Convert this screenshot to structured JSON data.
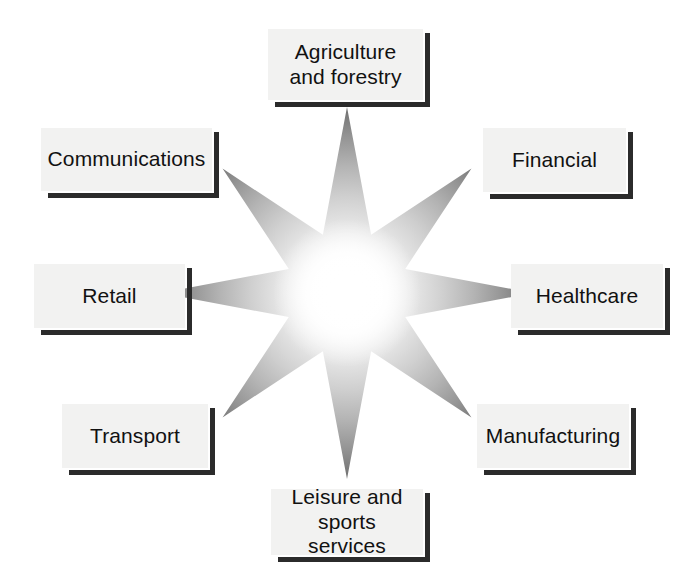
{
  "diagram": {
    "shape": "8-pointed-star",
    "background_color": "#ffffff",
    "box_fill_color": "#f2f2f1",
    "box_shadow_color": "#2b2b2b",
    "text_color": "#111111",
    "star_gradient": {
      "center_color": "#ffffff",
      "mid_color": "#c9c9c9",
      "edge_color": "#6f6f6f"
    },
    "star_center": {
      "x": 347,
      "y": 293
    },
    "star_outer_radius_cardinal": 186,
    "star_outer_radius_diagonal": 176,
    "star_inner_radius": 63,
    "nodes": [
      {
        "id": "agriculture-and-forestry",
        "label": "Agriculture\nand forestry",
        "position": "top",
        "box": {
          "x": 268,
          "y": 29,
          "w": 155,
          "h": 71
        },
        "font_size": 21
      },
      {
        "id": "financial",
        "label": "Financial",
        "position": "top-right",
        "box": {
          "x": 483,
          "y": 128,
          "w": 143,
          "h": 64
        },
        "font_size": 21
      },
      {
        "id": "healthcare",
        "label": "Healthcare",
        "position": "right",
        "box": {
          "x": 511,
          "y": 264,
          "w": 152,
          "h": 64
        },
        "font_size": 21
      },
      {
        "id": "manufacturing",
        "label": "Manufacturing",
        "position": "bottom-right",
        "box": {
          "x": 477,
          "y": 404,
          "w": 152,
          "h": 64
        },
        "font_size": 21
      },
      {
        "id": "leisure-and-sports-services",
        "label": "Leisure and\nsports services",
        "position": "bottom",
        "box": {
          "x": 271,
          "y": 489,
          "w": 152,
          "h": 66
        },
        "font_size": 21
      },
      {
        "id": "transport",
        "label": "Transport",
        "position": "bottom-left",
        "box": {
          "x": 62,
          "y": 404,
          "w": 146,
          "h": 64
        },
        "font_size": 21
      },
      {
        "id": "retail",
        "label": "Retail",
        "position": "left",
        "box": {
          "x": 34,
          "y": 264,
          "w": 151,
          "h": 64
        },
        "font_size": 21
      },
      {
        "id": "communications",
        "label": "Communications",
        "position": "top-left",
        "box": {
          "x": 41,
          "y": 128,
          "w": 171,
          "h": 63
        },
        "font_size": 21
      }
    ]
  }
}
